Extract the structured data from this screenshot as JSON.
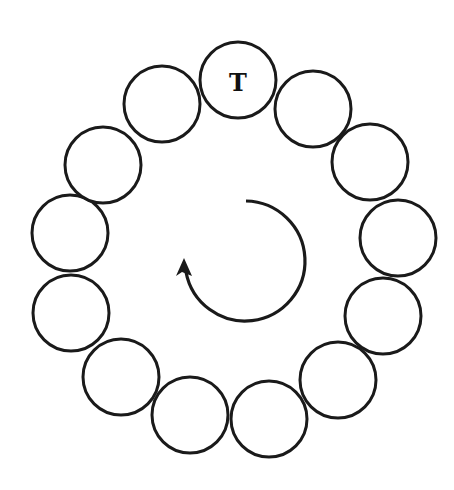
{
  "diagram": {
    "type": "circular-arrangement",
    "stroke_color": "#1a1a1a",
    "background": "#ffffff",
    "circle_radius": 38,
    "circles": [
      {
        "id": 1,
        "cx": 238,
        "cy": 80,
        "label": "T"
      },
      {
        "id": 2,
        "cx": 313,
        "cy": 109,
        "label": ""
      },
      {
        "id": 3,
        "cx": 370,
        "cy": 162,
        "label": ""
      },
      {
        "id": 4,
        "cx": 398,
        "cy": 238,
        "label": ""
      },
      {
        "id": 5,
        "cx": 383,
        "cy": 316,
        "label": ""
      },
      {
        "id": 6,
        "cx": 338,
        "cy": 380,
        "label": ""
      },
      {
        "id": 7,
        "cx": 269,
        "cy": 419,
        "label": ""
      },
      {
        "id": 8,
        "cx": 190,
        "cy": 415,
        "label": ""
      },
      {
        "id": 9,
        "cx": 121,
        "cy": 377,
        "label": ""
      },
      {
        "id": 10,
        "cx": 71,
        "cy": 313,
        "label": ""
      },
      {
        "id": 11,
        "cx": 70,
        "cy": 233,
        "label": ""
      },
      {
        "id": 12,
        "cx": 103,
        "cy": 165,
        "label": ""
      },
      {
        "id": 13,
        "cx": 162,
        "cy": 104,
        "label": ""
      }
    ],
    "rotation_arrow": {
      "direction": "clockwise",
      "center_x": 244,
      "center_y": 260,
      "radius": 60
    }
  }
}
